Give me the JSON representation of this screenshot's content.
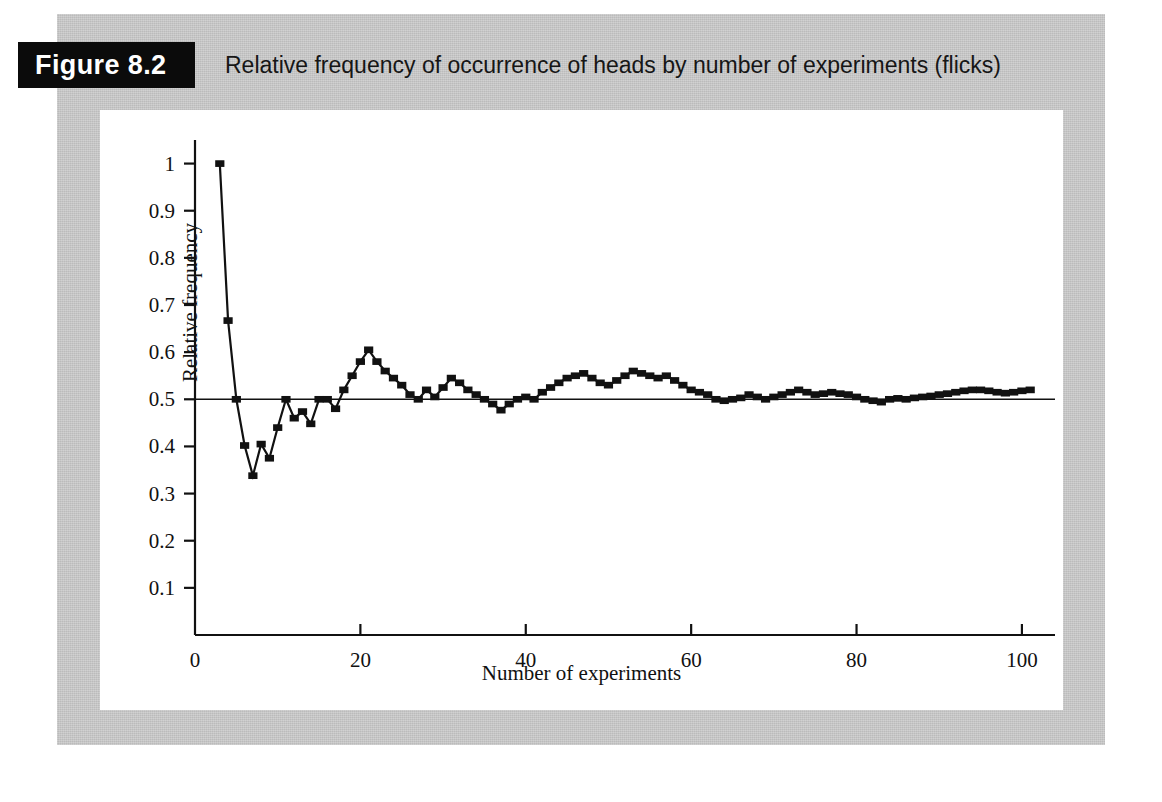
{
  "figure": {
    "tag": "Figure 8.2",
    "caption": "Relative frequency of occurrence of heads by number of experiments (flicks)"
  },
  "colors": {
    "panel_grey": "#c8c8c8",
    "tag_background": "#0b0b0b",
    "tag_text": "#ffffff",
    "plot_background": "#ffffff",
    "axis": "#111111",
    "series": "#111111",
    "reference_line": "#111111"
  },
  "chart_data": {
    "type": "line",
    "title": "Relative frequency of occurrence of heads by number of experiments (flicks)",
    "xlabel": "Number of experiments",
    "ylabel": "Relative frequency",
    "xlim": [
      0,
      104
    ],
    "ylim": [
      0,
      1.05
    ],
    "xticks": [
      0,
      20,
      40,
      60,
      80,
      100
    ],
    "xticklabels": [
      "0",
      "20",
      "40",
      "60",
      "80",
      "100"
    ],
    "yticks": [
      0.1,
      0.2,
      0.3,
      0.4,
      0.5,
      0.6,
      0.7,
      0.8,
      0.9,
      1
    ],
    "yticklabels": [
      "0.1",
      "0.2",
      "0.3",
      "0.4",
      "0.5",
      "0.6",
      "0.7",
      "0.8",
      "0.9",
      "1"
    ],
    "grid": false,
    "legend": false,
    "markers": "square",
    "reference_line": {
      "y": 0.5,
      "label": ""
    },
    "series": [
      {
        "name": "Relative frequency of heads",
        "x": [
          3,
          4,
          5,
          6,
          7,
          8,
          9,
          10,
          11,
          12,
          13,
          14,
          15,
          16,
          17,
          18,
          19,
          20,
          21,
          22,
          23,
          24,
          25,
          26,
          27,
          28,
          29,
          30,
          31,
          32,
          33,
          34,
          35,
          36,
          37,
          38,
          39,
          40,
          41,
          42,
          43,
          44,
          45,
          46,
          47,
          48,
          49,
          50,
          51,
          52,
          53,
          54,
          55,
          56,
          57,
          58,
          59,
          60,
          61,
          62,
          63,
          64,
          65,
          66,
          67,
          68,
          69,
          70,
          71,
          72,
          73,
          74,
          75,
          76,
          77,
          78,
          79,
          80,
          81,
          82,
          83,
          84,
          85,
          86,
          87,
          88,
          89,
          90,
          91,
          92,
          93,
          94,
          95,
          96,
          97,
          98,
          99,
          100,
          101
        ],
        "y": [
          1.0,
          0.667,
          0.5,
          0.402,
          0.338,
          0.405,
          0.375,
          0.44,
          0.5,
          0.46,
          0.474,
          0.448,
          0.5,
          0.5,
          0.48,
          0.52,
          0.55,
          0.58,
          0.605,
          0.58,
          0.56,
          0.545,
          0.53,
          0.51,
          0.5,
          0.52,
          0.505,
          0.525,
          0.545,
          0.535,
          0.52,
          0.51,
          0.5,
          0.49,
          0.477,
          0.49,
          0.5,
          0.505,
          0.5,
          0.515,
          0.525,
          0.535,
          0.545,
          0.55,
          0.555,
          0.545,
          0.535,
          0.53,
          0.54,
          0.55,
          0.56,
          0.555,
          0.55,
          0.545,
          0.55,
          0.54,
          0.53,
          0.52,
          0.515,
          0.51,
          0.5,
          0.497,
          0.5,
          0.503,
          0.51,
          0.505,
          0.5,
          0.505,
          0.51,
          0.515,
          0.52,
          0.515,
          0.51,
          0.512,
          0.515,
          0.512,
          0.51,
          0.505,
          0.5,
          0.497,
          0.494,
          0.5,
          0.502,
          0.5,
          0.503,
          0.505,
          0.507,
          0.51,
          0.512,
          0.515,
          0.518,
          0.52,
          0.52,
          0.518,
          0.515,
          0.513,
          0.515,
          0.518,
          0.52
        ]
      }
    ]
  }
}
